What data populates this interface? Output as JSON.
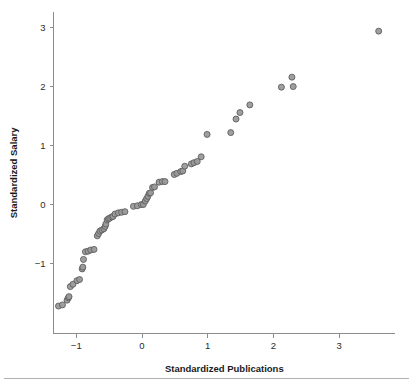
{
  "chart_data": {
    "type": "scatter",
    "title": "",
    "xlabel": "Standardized Publications",
    "ylabel": "Standardized Salary",
    "xlim": [
      -1.45,
      3.85
    ],
    "ylim": [
      -1.85,
      3.25
    ],
    "xticks": [
      -1,
      0,
      1,
      2,
      3
    ],
    "xticklabels": [
      "-1",
      "0",
      "1",
      "2",
      "3"
    ],
    "yticks": [
      -1,
      0,
      1,
      2,
      3
    ],
    "yticklabels": [
      "-1",
      "0",
      "1",
      "2",
      "3"
    ],
    "grid": false,
    "legend": null,
    "marker": {
      "shape": "circle",
      "fill_color": "#9a9a9a",
      "edge_color": "#5e5e5e",
      "size_px": 6
    },
    "n_points": 61,
    "points": [
      {
        "x": -1.27,
        "y": -1.73
      },
      {
        "x": -1.21,
        "y": -1.71
      },
      {
        "x": -1.14,
        "y": -1.63
      },
      {
        "x": -1.12,
        "y": -1.59
      },
      {
        "x": -1.11,
        "y": -1.57
      },
      {
        "x": -1.09,
        "y": -1.4
      },
      {
        "x": -1.05,
        "y": -1.36
      },
      {
        "x": -0.99,
        "y": -1.3
      },
      {
        "x": -0.95,
        "y": -1.28
      },
      {
        "x": -0.91,
        "y": -1.1
      },
      {
        "x": -0.9,
        "y": -1.07
      },
      {
        "x": -0.89,
        "y": -0.94
      },
      {
        "x": -0.86,
        "y": -0.81
      },
      {
        "x": -0.82,
        "y": -0.8
      },
      {
        "x": -0.78,
        "y": -0.78
      },
      {
        "x": -0.73,
        "y": -0.77
      },
      {
        "x": -0.68,
        "y": -0.54
      },
      {
        "x": -0.66,
        "y": -0.5
      },
      {
        "x": -0.64,
        "y": -0.46
      },
      {
        "x": -0.61,
        "y": -0.44
      },
      {
        "x": -0.58,
        "y": -0.42
      },
      {
        "x": -0.56,
        "y": -0.38
      },
      {
        "x": -0.55,
        "y": -0.34
      },
      {
        "x": -0.53,
        "y": -0.27
      },
      {
        "x": -0.51,
        "y": -0.25
      },
      {
        "x": -0.49,
        "y": -0.24
      },
      {
        "x": -0.46,
        "y": -0.22
      },
      {
        "x": -0.44,
        "y": -0.21
      },
      {
        "x": -0.41,
        "y": -0.17
      },
      {
        "x": -0.36,
        "y": -0.15
      },
      {
        "x": -0.31,
        "y": -0.14
      },
      {
        "x": -0.26,
        "y": -0.13
      },
      {
        "x": -0.13,
        "y": -0.04
      },
      {
        "x": -0.07,
        "y": -0.03
      },
      {
        "x": -0.01,
        "y": -0.01
      },
      {
        "x": 0.02,
        "y": -0.01
      },
      {
        "x": 0.05,
        "y": 0.05
      },
      {
        "x": 0.07,
        "y": 0.09
      },
      {
        "x": 0.09,
        "y": 0.13
      },
      {
        "x": 0.11,
        "y": 0.18
      },
      {
        "x": 0.13,
        "y": 0.19
      },
      {
        "x": 0.16,
        "y": 0.28
      },
      {
        "x": 0.19,
        "y": 0.29
      },
      {
        "x": 0.26,
        "y": 0.37
      },
      {
        "x": 0.31,
        "y": 0.38
      },
      {
        "x": 0.35,
        "y": 0.38
      },
      {
        "x": 0.49,
        "y": 0.5
      },
      {
        "x": 0.53,
        "y": 0.52
      },
      {
        "x": 0.59,
        "y": 0.55
      },
      {
        "x": 0.62,
        "y": 0.56
      },
      {
        "x": 0.65,
        "y": 0.64
      },
      {
        "x": 0.75,
        "y": 0.68
      },
      {
        "x": 0.79,
        "y": 0.7
      },
      {
        "x": 0.84,
        "y": 0.72
      },
      {
        "x": 0.9,
        "y": 0.8
      },
      {
        "x": 0.99,
        "y": 1.18
      },
      {
        "x": 1.35,
        "y": 1.21
      },
      {
        "x": 1.43,
        "y": 1.44
      },
      {
        "x": 1.49,
        "y": 1.55
      },
      {
        "x": 1.64,
        "y": 1.68
      },
      {
        "x": 2.12,
        "y": 1.98
      },
      {
        "x": 2.28,
        "y": 2.15
      },
      {
        "x": 2.3,
        "y": 1.99
      },
      {
        "x": 3.6,
        "y": 2.93
      }
    ]
  },
  "figure": {
    "background_color": "#ffffff",
    "axis_color": "#8c8c8c",
    "footer_rule_color": "#b0b0b0"
  }
}
